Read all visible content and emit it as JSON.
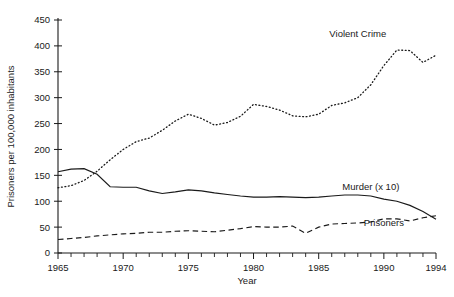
{
  "chart_data": {
    "type": "line",
    "title": "",
    "xlabel": "Year",
    "ylabel": "Prisoners per 100,000 inhabitants",
    "xlim": [
      1965,
      1994
    ],
    "ylim": [
      0,
      450
    ],
    "grid": false,
    "legend_position": "inline-annotations",
    "y_ticks": [
      0,
      50,
      100,
      150,
      200,
      250,
      300,
      350,
      400,
      450
    ],
    "y_tick_labels": [
      "0",
      "50",
      "100",
      "150",
      "200",
      "250",
      "300",
      "350",
      "400",
      "450"
    ],
    "x_ticks_major": [
      1965,
      1970,
      1975,
      1980,
      1985,
      1990,
      1994
    ],
    "x_tick_labels": [
      "1965",
      "1970",
      "1975",
      "1980",
      "1985",
      "1990",
      "1994"
    ],
    "x_ticks_minor_step": 1,
    "x": [
      1965,
      1966,
      1967,
      1968,
      1969,
      1970,
      1971,
      1972,
      1973,
      1974,
      1975,
      1976,
      1977,
      1978,
      1979,
      1980,
      1981,
      1982,
      1983,
      1984,
      1985,
      1986,
      1987,
      1988,
      1989,
      1990,
      1991,
      1992,
      1993,
      1994
    ],
    "series": [
      {
        "name": "Violent Crime",
        "style": "dotted",
        "label_x": 1988,
        "label_y": 418,
        "values": [
          126,
          130,
          140,
          158,
          180,
          200,
          215,
          222,
          237,
          255,
          268,
          260,
          247,
          252,
          264,
          287,
          283,
          276,
          265,
          263,
          268,
          285,
          290,
          300,
          325,
          362,
          392,
          391,
          368,
          382
        ]
      },
      {
        "name": "Prisoners",
        "style": "solid",
        "label_x": 1990,
        "label_y": 52,
        "values": [
          157,
          162,
          163,
          152,
          128,
          127,
          127,
          120,
          115,
          118,
          122,
          120,
          116,
          113,
          110,
          108,
          108,
          109,
          108,
          107,
          108,
          110,
          112,
          112,
          110,
          104,
          100,
          92,
          80,
          65
        ]
      },
      {
        "name": "Murder (x 10)",
        "style": "dashed",
        "label_x": 1989,
        "label_y": 122,
        "values": [
          26,
          28,
          30,
          33,
          35,
          37,
          38,
          40,
          40,
          42,
          43,
          42,
          41,
          44,
          47,
          51,
          50,
          50,
          52,
          38,
          50,
          56,
          57,
          58,
          60,
          66,
          66,
          62,
          68,
          72
        ]
      }
    ]
  }
}
